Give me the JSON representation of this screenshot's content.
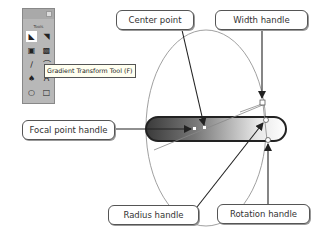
{
  "toolbox": {
    "title": "Tools",
    "tools": [
      {
        "name": "selection-tool",
        "glyph": "◣",
        "selected": true
      },
      {
        "name": "subselection-tool",
        "glyph": "◥",
        "selected": false
      },
      {
        "name": "free-transform-tool",
        "glyph": "▣",
        "selected": false
      },
      {
        "name": "gradient-transform-tool",
        "glyph": "▩",
        "selected": false
      },
      {
        "name": "line-tool",
        "glyph": "∕",
        "selected": false
      },
      {
        "name": "lasso-tool",
        "glyph": "⌒",
        "selected": false
      },
      {
        "name": "pen-tool",
        "glyph": "♠",
        "selected": false
      },
      {
        "name": "text-tool",
        "glyph": "A",
        "selected": false
      },
      {
        "name": "oval-tool",
        "glyph": "○",
        "selected": false
      },
      {
        "name": "rectangle-tool",
        "glyph": "□",
        "selected": false
      }
    ],
    "tooltip": "Gradient Transform Tool (F)"
  },
  "labels": {
    "center_point": "Center point",
    "width_handle": "Width handle",
    "focal_point_handle": "Focal point handle",
    "radius_handle": "Radius handle",
    "rotation_handle": "Rotation handle"
  },
  "colors": {
    "line": "#222222",
    "ellipse_stroke": "#777777",
    "gradient_dark": "#555555",
    "gradient_light": "#ffffff"
  }
}
